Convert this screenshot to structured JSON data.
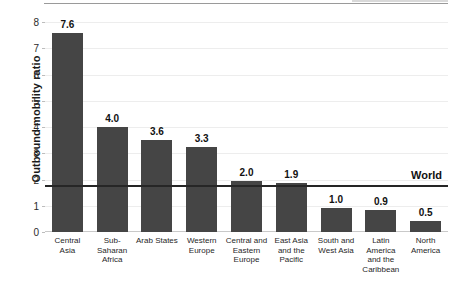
{
  "chart_data": {
    "type": "bar",
    "title": "",
    "xlabel": "",
    "ylabel": "Outbound mobility ratio",
    "ylim": [
      0,
      8
    ],
    "yticks": [
      0,
      1,
      2,
      3,
      4,
      5,
      6,
      7,
      8
    ],
    "grid": true,
    "legend": "none",
    "categories": [
      "Central\nAsia",
      "Sub-Saharan\nAfrica",
      "Arab States",
      "Western\nEurope",
      "Central and\nEastern\nEurope",
      "East Asia\nand the\nPacific",
      "South and\nWest Asia",
      "Latin America\nand the\nCaribbean",
      "North\nAmerica"
    ],
    "values": [
      7.6,
      4.0,
      3.6,
      3.3,
      2.0,
      1.9,
      1.0,
      0.9,
      0.5
    ],
    "bar_tops": [
      7.6,
      4.0,
      3.5,
      3.25,
      1.95,
      1.85,
      0.9,
      0.85,
      0.42
    ],
    "data_labels": [
      "7.6",
      "4.0",
      "3.6",
      "3.3",
      "2.0",
      "1.9",
      "1.0",
      "0.9",
      "0.5"
    ],
    "reference_line": {
      "label": "World",
      "value": 1.8
    },
    "colors": {
      "bar": "#454545",
      "reference_line": "#262626",
      "gridline": "#ededed",
      "text": "#111111",
      "background": "#ffffff"
    }
  }
}
